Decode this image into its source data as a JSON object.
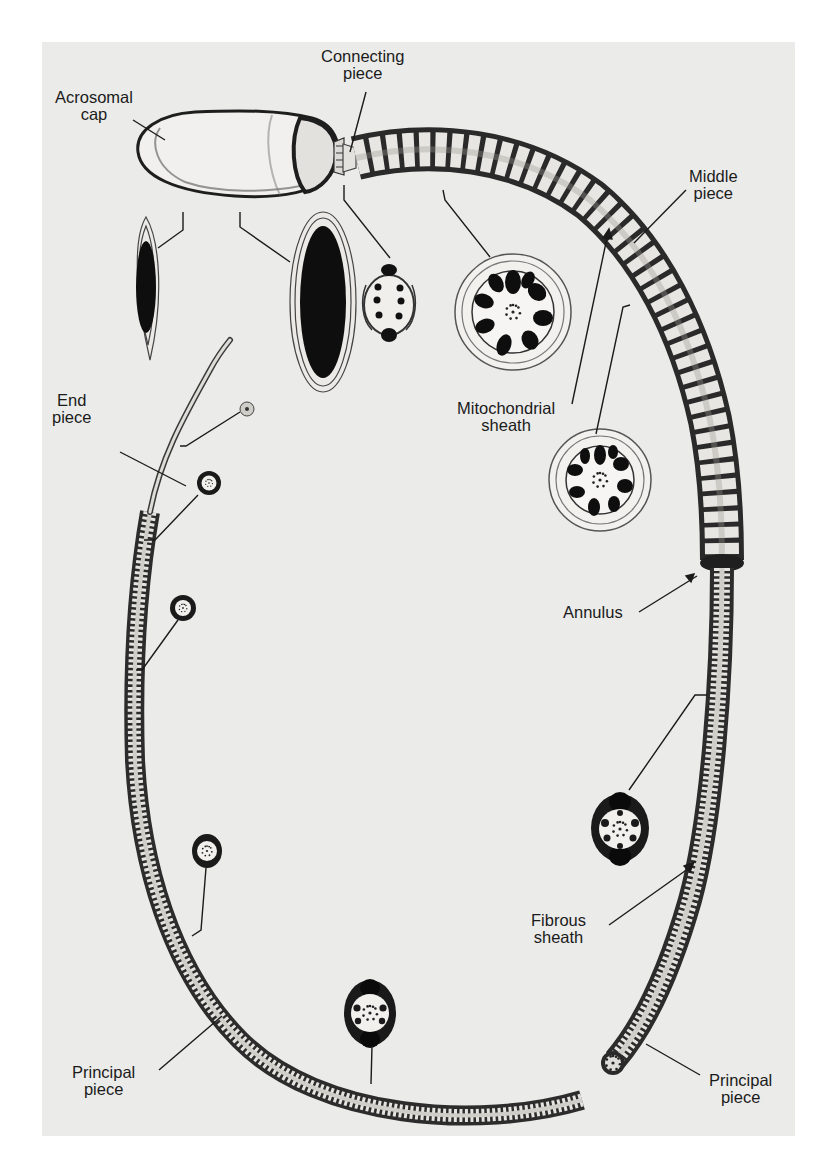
{
  "figure": {
    "background_color": "#ebebea",
    "ink_color": "#1b1b1b"
  },
  "labels": {
    "acrosomal_cap": {
      "line1": "Acrosomal",
      "line2": "cap"
    },
    "connecting_piece": {
      "line1": "Connecting",
      "line2": "piece"
    },
    "middle_piece": {
      "line1": "Middle",
      "line2": "piece"
    },
    "mitochondrial_sheath": {
      "line1": "Mitochondrial",
      "line2": "sheath"
    },
    "end_piece": {
      "line1": "End",
      "line2": "piece"
    },
    "annulus": {
      "line1": "Annulus"
    },
    "fibrous_sheath": {
      "line1": "Fibrous",
      "line2": "sheath"
    },
    "principal_piece_left": {
      "line1": "Principal",
      "line2": "piece"
    },
    "principal_piece_right": {
      "line1": "Principal",
      "line2": "piece"
    }
  },
  "cross_sections": [
    {
      "id": "head-tip",
      "region": "head (acrosomal cap)",
      "shape": "narrow ellipse"
    },
    {
      "id": "head-nucleus",
      "region": "head (nucleus)",
      "shape": "large ellipse"
    },
    {
      "id": "neck",
      "region": "connecting piece",
      "shape": "small round"
    },
    {
      "id": "middle-1",
      "region": "middle piece",
      "shape": "round with 9 dense fibers"
    },
    {
      "id": "middle-2",
      "region": "middle piece",
      "shape": "round with 9 dense fibers"
    },
    {
      "id": "principal-right",
      "region": "principal piece",
      "shape": "oval with dorsal/ventral columns"
    },
    {
      "id": "principal-bottom",
      "region": "principal piece",
      "shape": "oval with dorsal/ventral columns"
    },
    {
      "id": "principal-left",
      "region": "principal piece",
      "shape": "small oval"
    },
    {
      "id": "principal-distal-1",
      "region": "principal piece",
      "shape": "small round"
    },
    {
      "id": "principal-distal-2",
      "region": "principal piece",
      "shape": "small round"
    },
    {
      "id": "end",
      "region": "end piece",
      "shape": "tiny round"
    }
  ]
}
